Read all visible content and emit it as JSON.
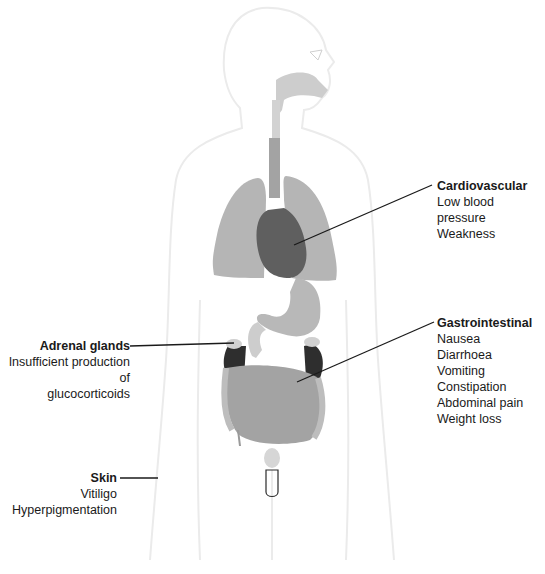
{
  "diagram": {
    "type": "anatomical-symptom-map",
    "colors": {
      "body_outline": "#ececec",
      "organ_light": "#c8c8c8",
      "organ_mid": "#a9a9a9",
      "heart": "#5f5f5f",
      "adrenal": "#2e2e2e",
      "leader_line": "#1a1a1a"
    }
  },
  "labels": {
    "cardiovascular": {
      "title": "Cardiovascular",
      "items": [
        "Low blood pressure",
        "Weakness"
      ]
    },
    "gastrointestinal": {
      "title": "Gastrointestinal",
      "items": [
        "Nausea",
        "Diarrhoea",
        "Vomiting",
        "Constipation",
        "Abdominal pain",
        "Weight loss"
      ]
    },
    "adrenal": {
      "title": "Adrenal glands",
      "items": [
        "Insufficient production of",
        "glucocorticoids"
      ]
    },
    "skin": {
      "title": "Skin",
      "items": [
        "Vitiligo",
        "Hyperpigmentation"
      ]
    }
  }
}
